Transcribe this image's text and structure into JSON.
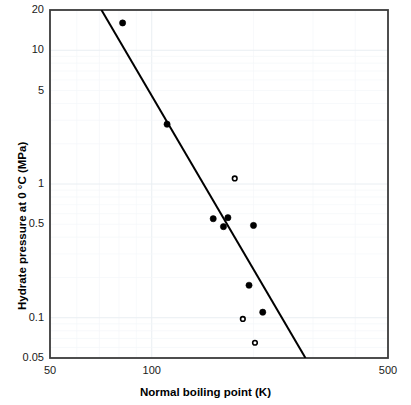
{
  "chart_data": {
    "type": "scatter",
    "title": "",
    "xlabel": "Normal boiling point (K)",
    "ylabel": "Hydrate pressure at 0 °C (MPa)",
    "xscale": "log",
    "yscale": "log",
    "xlim": [
      50,
      500
    ],
    "ylim": [
      0.05,
      20
    ],
    "grid": true,
    "legend": "none",
    "xticks": [
      {
        "value": 50,
        "label": "50"
      },
      {
        "value": 100,
        "label": "100"
      },
      {
        "value": 500,
        "label": "500"
      }
    ],
    "yticks": [
      {
        "value": 20,
        "label": "20"
      },
      {
        "value": 10,
        "label": "10"
      },
      {
        "value": 5,
        "label": "5"
      },
      {
        "value": 1,
        "label": "1"
      },
      {
        "value": 0.5,
        "label": "0.5"
      },
      {
        "value": 0.1,
        "label": "0.1"
      },
      {
        "value": 0.05,
        "label": "0.05"
      }
    ],
    "series": [
      {
        "name": "filled-markers",
        "marker": "filled-circle",
        "color": "#000000",
        "points": [
          {
            "x": 82,
            "y": 16.0
          },
          {
            "x": 111,
            "y": 2.8
          },
          {
            "x": 152,
            "y": 0.55
          },
          {
            "x": 168,
            "y": 0.56
          },
          {
            "x": 163,
            "y": 0.48
          },
          {
            "x": 200,
            "y": 0.49
          },
          {
            "x": 194,
            "y": 0.175
          },
          {
            "x": 213,
            "y": 0.11
          }
        ]
      },
      {
        "name": "open-markers",
        "marker": "open-circle",
        "color": "#000000",
        "points": [
          {
            "x": 176,
            "y": 1.1
          },
          {
            "x": 186,
            "y": 0.098
          },
          {
            "x": 202,
            "y": 0.065
          }
        ]
      }
    ],
    "trendline": {
      "name": "correlation-line",
      "color": "#000000",
      "start": {
        "x": 71,
        "y": 20
      },
      "end": {
        "x": 285,
        "y": 0.05
      }
    }
  }
}
